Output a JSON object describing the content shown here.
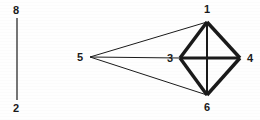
{
  "figure": {
    "width": 260,
    "height": 120,
    "background_color": "#fefefe",
    "ink_color": "#1a1a1a"
  },
  "scale_bar": {
    "name": "vertical-scale-bar",
    "top_label": "8",
    "bottom_label": "2",
    "line": {
      "x": 17,
      "y1": 18,
      "y2": 100,
      "stroke_width": 1.2
    },
    "top_label_pos": {
      "x": 16,
      "y": 10
    },
    "bottom_label_pos": {
      "x": 16,
      "y": 108
    }
  },
  "graph": {
    "nodes": [
      {
        "id": "1",
        "label": "1",
        "x": 207,
        "y": 22,
        "label_x": 207,
        "label_y": 9
      },
      {
        "id": "2",
        "label": "2",
        "x": 0,
        "y": 0,
        "label_x": 0,
        "label_y": 0
      },
      {
        "id": "3",
        "label": "3",
        "x": 180,
        "y": 58,
        "label_x": 170,
        "label_y": 58
      },
      {
        "id": "4",
        "label": "4",
        "x": 240,
        "y": 58,
        "label_x": 250,
        "label_y": 58
      },
      {
        "id": "5",
        "label": "5",
        "x": 90,
        "y": 57,
        "label_x": 80,
        "label_y": 57
      },
      {
        "id": "6",
        "label": "6",
        "x": 207,
        "y": 95,
        "label_x": 207,
        "label_y": 107
      }
    ],
    "thin_edges": [
      {
        "from": "5",
        "to": "1",
        "stroke_width": 1.0
      },
      {
        "from": "5",
        "to": "3",
        "stroke_width": 1.0
      },
      {
        "from": "5",
        "to": "6",
        "stroke_width": 1.0
      }
    ],
    "thick_edges": [
      {
        "from": "1",
        "to": "3",
        "stroke_width": 3.4
      },
      {
        "from": "1",
        "to": "4",
        "stroke_width": 3.4
      },
      {
        "from": "3",
        "to": "6",
        "stroke_width": 3.4
      },
      {
        "from": "4",
        "to": "6",
        "stroke_width": 3.4
      },
      {
        "from": "3",
        "to": "4",
        "stroke_width": 3.2
      },
      {
        "from": "1",
        "to": "6",
        "stroke_width": 2.0
      }
    ]
  }
}
